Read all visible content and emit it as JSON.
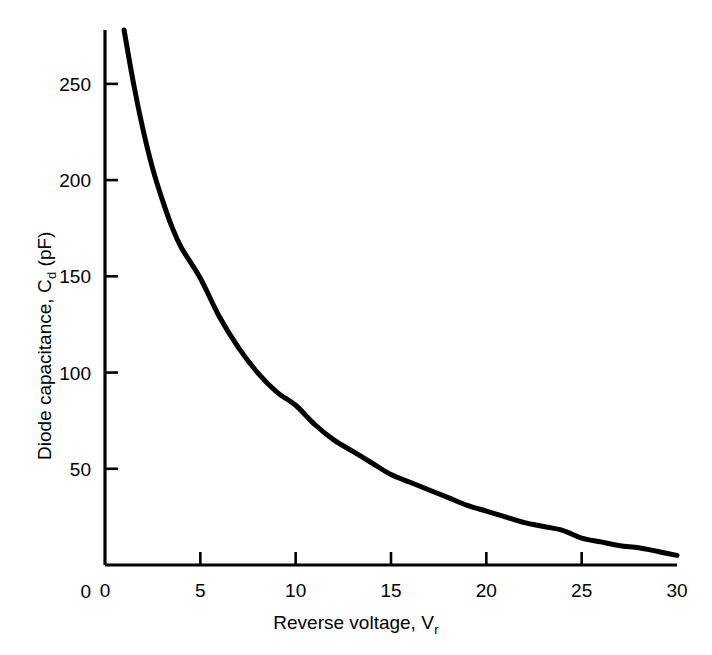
{
  "chart_data": {
    "type": "line",
    "title": "",
    "subtitle": "",
    "xlabel_main": "Reverse voltage, V",
    "xlabel_sub": "r",
    "ylabel_main": "Diode capacitance, C",
    "ylabel_sub": "d",
    "ylabel_unit": " (pF)",
    "xlim": [
      0,
      30
    ],
    "ylim": [
      0,
      278
    ],
    "grid": false,
    "legend": "none",
    "xticks": [
      0,
      5,
      10,
      15,
      20,
      25,
      30
    ],
    "xtick_labels": [
      "0",
      "5",
      "10",
      "15",
      "20",
      "25",
      "30"
    ],
    "yticks": [
      0,
      50,
      100,
      150,
      200,
      250
    ],
    "ytick_labels": [
      "0",
      "50",
      "100",
      "150",
      "200",
      "250"
    ],
    "series": [
      {
        "name": "Diode capacitance",
        "color": "#000000",
        "linewidth": 5,
        "x": [
          1.0,
          1.5,
          2.0,
          2.5,
          3.0,
          3.5,
          4.0,
          5.0,
          6.0,
          7.0,
          8.0,
          9.0,
          10.0,
          11.0,
          12.0,
          13.0,
          14.0,
          15.0,
          16.0,
          17.0,
          18.0,
          19.0,
          20.0,
          21.0,
          22.0,
          23.0,
          24.0,
          25.0,
          26.0,
          27.0,
          28.0,
          29.0,
          30.0
        ],
        "values": [
          278,
          250,
          226,
          206,
          190,
          176,
          165,
          149,
          129,
          113,
          100,
          90,
          83,
          73,
          65,
          59,
          53,
          47,
          43,
          39,
          35,
          31,
          28,
          25,
          22,
          20,
          18,
          14,
          12,
          10,
          9,
          7,
          5
        ]
      }
    ],
    "axis_color": "#000000",
    "background_color": "#ffffff"
  },
  "layout": {
    "plot_left_px": 105,
    "plot_right_px": 677,
    "plot_top_px": 30,
    "plot_bottom_px": 565
  }
}
